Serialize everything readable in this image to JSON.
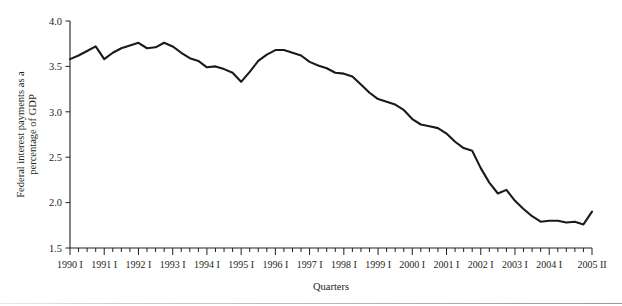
{
  "figure": {
    "background_color": "#ffffff",
    "line_color": "#1a1a1a",
    "axis_color": "#231f20"
  },
  "labels": {
    "ylabel_line1": "Federal interest payments as a",
    "ylabel_line2": "percentage of GDP",
    "xlabel": "Quarters"
  },
  "chart_data": {
    "type": "line",
    "title": "",
    "subtitle": "",
    "xlabel": "Quarters",
    "ylabel": "Federal interest payments as a percentage of GDP",
    "ylim": [
      1.5,
      4.0
    ],
    "ytick_labels": [
      "1.5",
      "2.0",
      "2.5",
      "3.0",
      "3.5",
      "4.0"
    ],
    "ytick_values": [
      1.5,
      2.0,
      2.5,
      3.0,
      3.5,
      4.0
    ],
    "grid": false,
    "legend": "none",
    "xtick_labels": [
      "1990 I",
      "1991 I",
      "1992 I",
      "1993 I",
      "1994 I",
      "1995 I",
      "1996 I",
      "1997 I",
      "1998 I",
      "1999 I",
      "2000 I",
      "2001 I",
      "2002 I",
      "2003 I",
      "2004 I",
      "2005 II"
    ],
    "xtick_label_indices": [
      0,
      4,
      8,
      12,
      16,
      20,
      24,
      28,
      32,
      36,
      40,
      44,
      48,
      52,
      56,
      61
    ],
    "x": [
      "1990 I",
      "1990 II",
      "1990 III",
      "1990 IV",
      "1991 I",
      "1991 II",
      "1991 III",
      "1991 IV",
      "1992 I",
      "1992 II",
      "1992 III",
      "1992 IV",
      "1993 I",
      "1993 II",
      "1993 III",
      "1993 IV",
      "1994 I",
      "1994 II",
      "1994 III",
      "1994 IV",
      "1995 I",
      "1995 II",
      "1995 III",
      "1995 IV",
      "1996 I",
      "1996 II",
      "1996 III",
      "1996 IV",
      "1997 I",
      "1997 II",
      "1997 III",
      "1997 IV",
      "1998 I",
      "1998 II",
      "1998 III",
      "1998 IV",
      "1999 I",
      "1999 II",
      "1999 III",
      "1999 IV",
      "2000 I",
      "2000 II",
      "2000 III",
      "2000 IV",
      "2001 I",
      "2001 II",
      "2001 III",
      "2001 IV",
      "2002 I",
      "2002 II",
      "2002 III",
      "2002 IV",
      "2003 I",
      "2003 II",
      "2003 III",
      "2003 IV",
      "2004 I",
      "2004 II",
      "2004 III",
      "2004 IV",
      "2005 I",
      "2005 II"
    ],
    "values": [
      3.58,
      3.62,
      3.67,
      3.72,
      3.58,
      3.65,
      3.7,
      3.73,
      3.76,
      3.7,
      3.71,
      3.76,
      3.72,
      3.65,
      3.59,
      3.56,
      3.49,
      3.5,
      3.47,
      3.43,
      3.33,
      3.44,
      3.56,
      3.63,
      3.68,
      3.68,
      3.65,
      3.62,
      3.55,
      3.51,
      3.48,
      3.43,
      3.42,
      3.39,
      3.3,
      3.21,
      3.14,
      3.11,
      3.08,
      3.02,
      2.92,
      2.86,
      2.84,
      2.82,
      2.76,
      2.67,
      2.6,
      2.57,
      2.38,
      2.22,
      2.1,
      2.14,
      2.02,
      1.93,
      1.85,
      1.79,
      1.8,
      1.8,
      1.78,
      1.79,
      1.76,
      1.9
    ]
  }
}
